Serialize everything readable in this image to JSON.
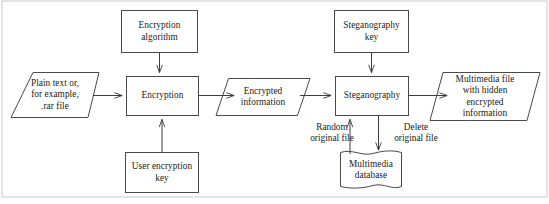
{
  "diagram": {
    "type": "flowchart",
    "stroke_color": "#4a4a4a",
    "connector_color": "#3d3d3d",
    "background_color": "#ffffff",
    "frame_color": "#c9c9c9",
    "nodes": [
      {
        "id": "encryption-algorithm",
        "label": "Encryption\nalgorithm",
        "shape": "rectangle"
      },
      {
        "id": "steganography-key",
        "label": "Steganography\nkey",
        "shape": "rectangle"
      },
      {
        "id": "plain-text-input",
        "label": "Plain text or,\nfor example,\n.rar file",
        "shape": "parallelogram"
      },
      {
        "id": "encryption",
        "label": "Encryption",
        "shape": "rectangle"
      },
      {
        "id": "encrypted-information",
        "label": "Encrypted\ninformation",
        "shape": "parallelogram"
      },
      {
        "id": "steganography",
        "label": "Steganography",
        "shape": "rectangle"
      },
      {
        "id": "multimedia-file-output",
        "label": "Multimedia file\nwith hidden\nencrypted\ninformation",
        "shape": "parallelogram"
      },
      {
        "id": "user-encryption-key",
        "label": "User encryption\nkey",
        "shape": "rectangle"
      },
      {
        "id": "multimedia-database",
        "label": "Multimedia\ndatabase",
        "shape": "document"
      }
    ],
    "edge_labels": [
      {
        "id": "random-original-file",
        "label": "Random\noriginal file"
      },
      {
        "id": "delete-original-file",
        "label": "Delete\noriginal file"
      }
    ]
  }
}
